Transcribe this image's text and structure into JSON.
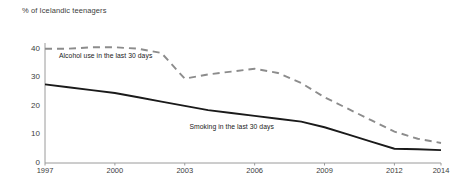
{
  "chart_data": {
    "type": "line",
    "title": "% of Icelandic teenagers",
    "xlabel": "",
    "ylabel": "",
    "x": [
      1997,
      1998,
      1999,
      2000,
      2001,
      2002,
      2003,
      2004,
      2005,
      2006,
      2007,
      2008,
      2009,
      2010,
      2011,
      2012,
      2013,
      2014
    ],
    "xlim": [
      1997,
      2014
    ],
    "ylim": [
      0,
      42
    ],
    "grid": false,
    "legend_position": "inline-annotations",
    "xticks": [
      "1997",
      "2000",
      "2003",
      "2006",
      "2009",
      "2012",
      "2014"
    ],
    "xtick_values": [
      1997,
      2000,
      2003,
      2006,
      2009,
      2012,
      2014
    ],
    "yticks": [
      "0",
      "10",
      "20",
      "30",
      "40"
    ],
    "ytick_values": [
      0,
      10,
      20,
      30,
      40
    ],
    "series": [
      {
        "name": "Alcohol use in the last 30 days",
        "style": "dashed",
        "color": "#8c8c8c",
        "values": [
          40,
          40,
          40.5,
          40.5,
          40,
          38.5,
          29.5,
          31,
          32,
          33,
          31.5,
          28,
          23,
          19,
          15,
          11,
          8.5,
          7
        ]
      },
      {
        "name": "Smoking in the last 30 days",
        "style": "solid",
        "color": "#1a1a1a",
        "values": [
          27.5,
          26.5,
          25.5,
          24.5,
          23,
          21.5,
          20,
          18.5,
          17.5,
          16.5,
          15.5,
          14.5,
          12.5,
          10,
          7.5,
          5,
          4.8,
          4.5
        ]
      }
    ],
    "annotations": [
      {
        "text": "Alcohol use in the last 30 days",
        "x": 1997.6,
        "y": 37.5
      },
      {
        "text": "Smoking in the last 30 days",
        "x": 2003.2,
        "y": 12.5
      }
    ]
  }
}
